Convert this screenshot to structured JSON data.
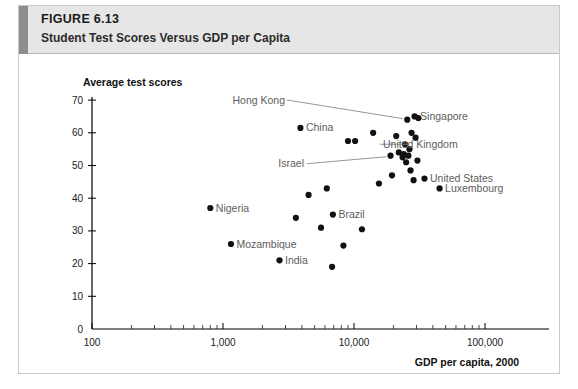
{
  "figure": {
    "number_prefix": "F",
    "number_rest": "IGURE",
    "number_full": "FIGURE 6.13",
    "number_value": "6.13",
    "title": "Student Test Scores Versus GDP per Capita"
  },
  "chart_data": {
    "type": "scatter",
    "title": "Student Test Scores Versus GDP per Capita",
    "xlabel": "GDP per capita, 2000",
    "ylabel": "Average test scores",
    "xscale": "log",
    "xlim": [
      100,
      150000
    ],
    "ylim": [
      0,
      70
    ],
    "grid": false,
    "legend": null,
    "xticks": [
      100,
      1000,
      10000,
      100000
    ],
    "xtick_labels": [
      "100",
      "1,000",
      "10,000",
      "100,000"
    ],
    "yticks": [
      0,
      10,
      20,
      30,
      40,
      50,
      60,
      70
    ],
    "ytick_labels": [
      "0",
      "10",
      "20",
      "30",
      "40",
      "50",
      "60",
      "70"
    ],
    "points": [
      {
        "label": "Nigeria",
        "x": 800,
        "y": 37,
        "labeled": true,
        "label_side": "right"
      },
      {
        "label": "Mozambique",
        "x": 1150,
        "y": 26,
        "labeled": true,
        "label_side": "right"
      },
      {
        "label": "India",
        "x": 2700,
        "y": 21,
        "labeled": true,
        "label_side": "right"
      },
      {
        "label": "China",
        "x": 3900,
        "y": 61.5,
        "labeled": true,
        "label_side": "right"
      },
      {
        "label": "Brazil",
        "x": 6900,
        "y": 35,
        "labeled": true,
        "label_side": "right"
      },
      {
        "label": "Israel",
        "x": 19000,
        "y": 53,
        "labeled": true,
        "label_side": "leader"
      },
      {
        "label": "Hong Kong",
        "x": 25500,
        "y": 64,
        "labeled": true,
        "label_side": "leader"
      },
      {
        "label": "Singapore",
        "x": 29000,
        "y": 65,
        "labeled": true,
        "label_side": "right"
      },
      {
        "label": "United Kingdom",
        "x": 24500,
        "y": 56.5,
        "labeled": true,
        "label_side": "leader"
      },
      {
        "label": "United States",
        "x": 34500,
        "y": 46,
        "labeled": true,
        "label_side": "right"
      },
      {
        "label": "Luxembourg",
        "x": 45000,
        "y": 43,
        "labeled": true,
        "label_side": "right"
      },
      {
        "label": "",
        "x": 3600,
        "y": 34,
        "labeled": false
      },
      {
        "label": "",
        "x": 4500,
        "y": 41,
        "labeled": false
      },
      {
        "label": "",
        "x": 5600,
        "y": 31,
        "labeled": false
      },
      {
        "label": "",
        "x": 6200,
        "y": 43,
        "labeled": false
      },
      {
        "label": "",
        "x": 6800,
        "y": 19,
        "labeled": false
      },
      {
        "label": "",
        "x": 8300,
        "y": 25.5,
        "labeled": false
      },
      {
        "label": "",
        "x": 9000,
        "y": 57.5,
        "labeled": false
      },
      {
        "label": "",
        "x": 10200,
        "y": 57.5,
        "labeled": false
      },
      {
        "label": "",
        "x": 11500,
        "y": 30.5,
        "labeled": false
      },
      {
        "label": "",
        "x": 14000,
        "y": 60,
        "labeled": false
      },
      {
        "label": "",
        "x": 15500,
        "y": 44.5,
        "labeled": false
      },
      {
        "label": "",
        "x": 19500,
        "y": 47,
        "labeled": false
      },
      {
        "label": "",
        "x": 21000,
        "y": 59,
        "labeled": false
      },
      {
        "label": "",
        "x": 22000,
        "y": 54,
        "labeled": false
      },
      {
        "label": "",
        "x": 23500,
        "y": 52.5,
        "labeled": false
      },
      {
        "label": "",
        "x": 24000,
        "y": 53.5,
        "labeled": false
      },
      {
        "label": "",
        "x": 25000,
        "y": 51,
        "labeled": false
      },
      {
        "label": "",
        "x": 26000,
        "y": 53,
        "labeled": false
      },
      {
        "label": "",
        "x": 26500,
        "y": 55,
        "labeled": false
      },
      {
        "label": "",
        "x": 27000,
        "y": 48.5,
        "labeled": false
      },
      {
        "label": "",
        "x": 27500,
        "y": 60,
        "labeled": false
      },
      {
        "label": "",
        "x": 28500,
        "y": 45.5,
        "labeled": false
      },
      {
        "label": "",
        "x": 29500,
        "y": 58.5,
        "labeled": false
      },
      {
        "label": "",
        "x": 30500,
        "y": 51.5,
        "labeled": false
      },
      {
        "label": "",
        "x": 31000,
        "y": 64.5,
        "labeled": false
      }
    ]
  }
}
